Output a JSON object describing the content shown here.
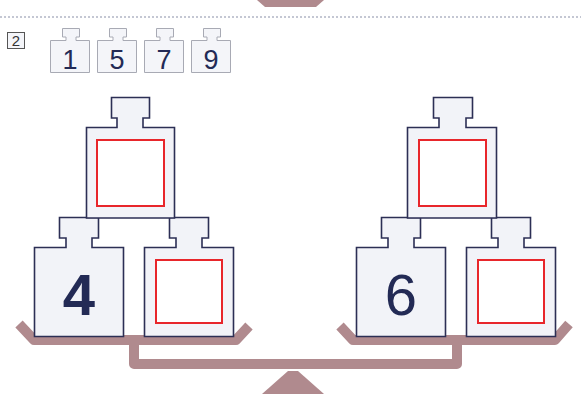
{
  "problem": {
    "number_label": "2",
    "choices": [
      {
        "value": "1"
      },
      {
        "value": "5"
      },
      {
        "value": "7"
      },
      {
        "value": "9"
      }
    ]
  },
  "left_side": {
    "top_weight": {
      "value": "",
      "answer_box": true
    },
    "bottom_left_weight": {
      "value": "4"
    },
    "bottom_right_weight": {
      "value": "",
      "answer_box": true
    }
  },
  "right_side": {
    "top_weight": {
      "value": "",
      "answer_box": true
    },
    "bottom_left_weight": {
      "value": "6"
    },
    "bottom_right_weight": {
      "value": "",
      "answer_box": true
    }
  },
  "colors": {
    "scale": "#b08a8e",
    "weight_outline": "#2c2f55",
    "weight_fill": "#f2f3f8",
    "answer_box": "#e8262b",
    "chip_outline": "#a8aab4",
    "chip_fill": "#f4f5f9",
    "number_text": "#232a55",
    "dotted_rule": "#8a8fa8"
  }
}
